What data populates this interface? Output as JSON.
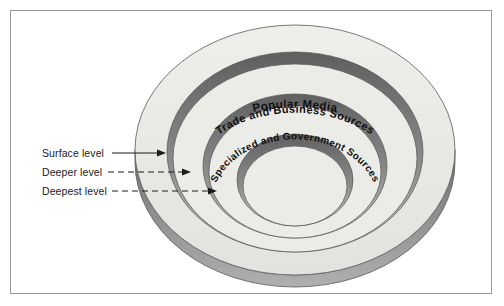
{
  "figure": {
    "title_visible": false,
    "background_color": "#ffffff",
    "border_color": "#9a9a9a"
  },
  "diagram": {
    "type": "concentric-bowl",
    "rings": [
      {
        "id": "outer",
        "label": "Popular Media",
        "depth_label": "Surface level",
        "face_color": "#ebebe8",
        "band_color_top": "#6e6e6e",
        "band_color_bottom": "#b4b4b4"
      },
      {
        "id": "middle",
        "label": "Trade and Business Sources",
        "depth_label": "Deeper level",
        "face_color": "#ebebe8",
        "band_color_top": "#6e6e6e",
        "band_color_bottom": "#b4b4b4"
      },
      {
        "id": "inner",
        "label": "Specialized and Government Sources",
        "depth_label": "Deepest level",
        "face_color": "#ebebe8",
        "band_color_top": "#6e6e6e",
        "band_color_bottom": "#b4b4b4"
      }
    ],
    "side_wall": {
      "color_top": "#7c7c7c",
      "color_bottom": "#a8a8a8"
    }
  },
  "callouts": [
    {
      "id": "surface",
      "label": "Surface level",
      "arrow_style": "solid"
    },
    {
      "id": "deeper",
      "label": "Deeper level",
      "arrow_style": "dashed"
    },
    {
      "id": "deepest",
      "label": "Deepest level",
      "arrow_style": "dashed"
    }
  ]
}
